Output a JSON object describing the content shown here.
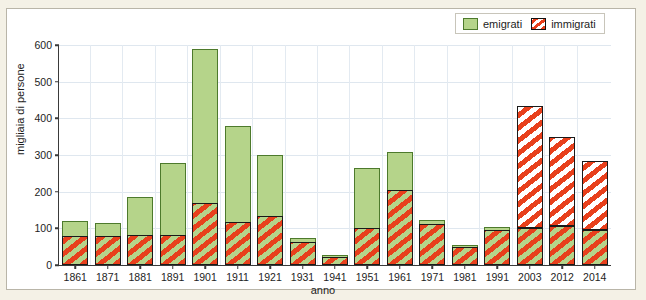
{
  "chart_data": {
    "type": "bar",
    "stacked": true,
    "title": "",
    "xlabel": "anno",
    "ylabel": "migliaia di persone",
    "ylim": [
      0,
      600
    ],
    "yticks": [
      0,
      100,
      200,
      300,
      400,
      500,
      600
    ],
    "grid": true,
    "legend_position": "top-right",
    "categories": [
      "1861",
      "1871",
      "1881",
      "1891",
      "1901",
      "1911",
      "1921",
      "1931",
      "1941",
      "1951",
      "1961",
      "1971",
      "1981",
      "1991",
      "2003",
      "2012",
      "2014"
    ],
    "series": [
      {
        "name": "immigrati",
        "color": "#e8401c",
        "values": [
          80,
          80,
          82,
          82,
          170,
          118,
          135,
          62,
          22,
          102,
          205,
          112,
          50,
          95,
          335,
          243,
          188
        ]
      },
      {
        "name": "emigrati",
        "color": "#b5d48a",
        "values": [
          40,
          35,
          103,
          196,
          420,
          260,
          166,
          13,
          6,
          163,
          103,
          10,
          5,
          10,
          100,
          107,
          95
        ]
      }
    ],
    "totals": [
      120,
      115,
      185,
      278,
      590,
      378,
      301,
      75,
      28,
      265,
      308,
      122,
      55,
      105,
      435,
      350,
      283
    ]
  },
  "legend": {
    "entries": [
      {
        "label": "emigrati",
        "swatch": "green-square"
      },
      {
        "label": "immigrati",
        "swatch": "red-striped-square"
      }
    ]
  },
  "axes": {
    "y_title": "migliaia di persone",
    "x_title": "anno",
    "y_tick_labels": [
      "0",
      "100",
      "200",
      "300",
      "400",
      "500",
      "600"
    ],
    "x_tick_labels": [
      "1861",
      "1871",
      "1881",
      "1891",
      "1901",
      "1911",
      "1921",
      "1931",
      "1941",
      "1951",
      "1961",
      "1971",
      "1981",
      "1991",
      "2003",
      "2012",
      "2014"
    ]
  },
  "colors": {
    "page_background": "#f4f1e6",
    "panel_background": "#ffffff",
    "panel_border": "#b9b5a8",
    "emigrati_fill": "#b5d48a",
    "emigrati_edge": "#4d7a2c",
    "immigrati_stripe": "#e8401c",
    "axis": "#3a3a3a",
    "gridline": "#dfe7ef",
    "text": "#1d1d1d"
  }
}
